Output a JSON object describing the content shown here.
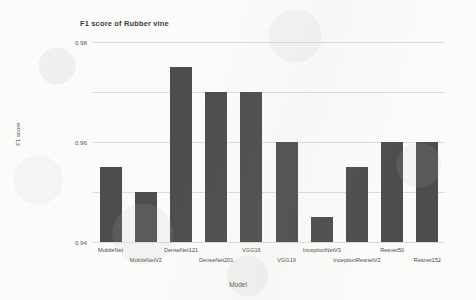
{
  "chart_data": {
    "type": "bar",
    "title": "F1 score of Rubber vine",
    "xlabel": "Model",
    "ylabel": "F1 score",
    "categories": [
      "MobileNet",
      "MobileNetV2",
      "DenseNet121",
      "DenseNet201",
      "VGG16",
      "VGG19",
      "InceptionNetV3",
      "InceptionResnetV2",
      "Resnet50",
      "Resnet152"
    ],
    "values": [
      0.93,
      0.92,
      0.97,
      0.96,
      0.96,
      0.94,
      0.91,
      0.93,
      0.94,
      0.94
    ],
    "ylim": [
      0.9,
      0.98
    ],
    "yticks": [
      0.9,
      0.92,
      0.94,
      0.96,
      0.98
    ],
    "ytick_labels": [
      "0.9",
      "0.92",
      "0.94",
      "0.96",
      "0.98"
    ],
    "grid": true,
    "legend": false,
    "bar_color": "#4d4d4d",
    "grid_color": "#dcdcda",
    "background_color": "#fbfbfa"
  }
}
